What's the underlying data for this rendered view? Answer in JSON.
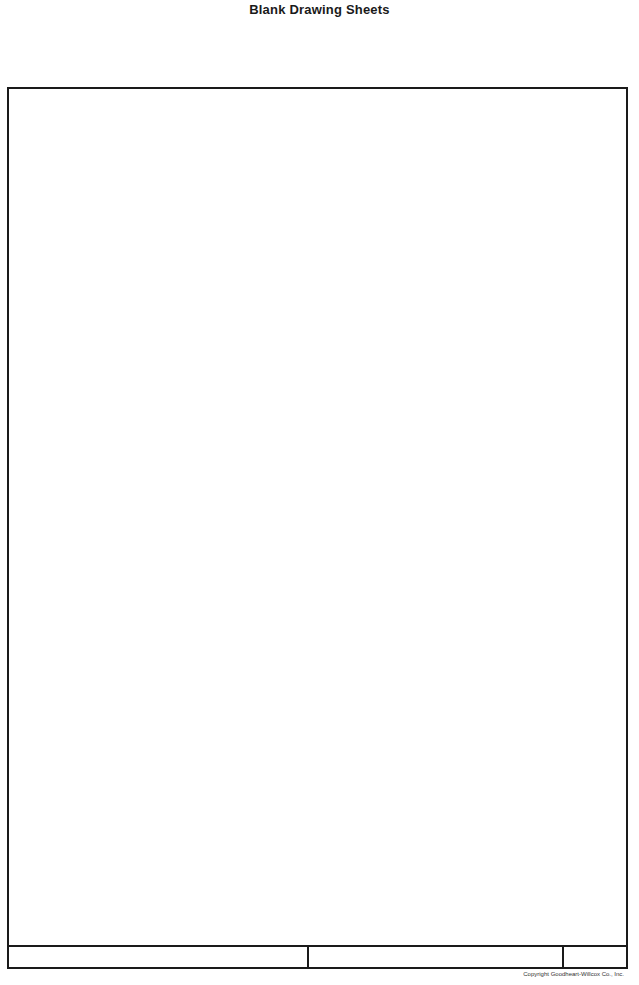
{
  "page": {
    "title": "Blank Drawing Sheets"
  },
  "sheet": {
    "title_block": {
      "cells": [
        "",
        "",
        ""
      ]
    }
  },
  "footer": {
    "copyright": "Copyright Goodheart-Willcox Co., Inc."
  }
}
